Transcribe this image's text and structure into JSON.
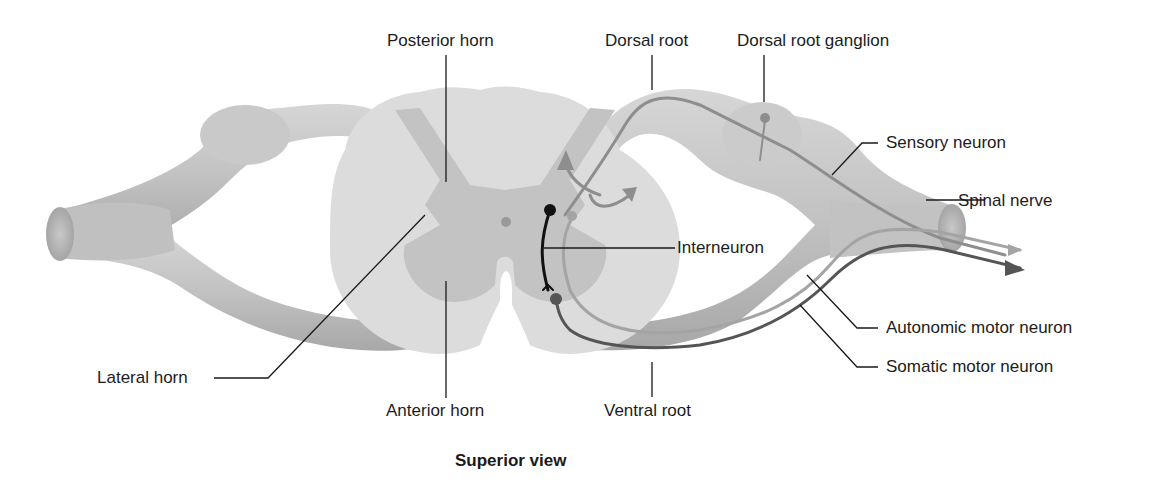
{
  "figure": {
    "caption": "Superior view",
    "labels": {
      "posterior_horn": "Posterior horn",
      "dorsal_root": "Dorsal root",
      "dorsal_root_ganglion": "Dorsal root ganglion",
      "sensory_neuron": "Sensory neuron",
      "spinal_nerve": "Spinal nerve",
      "interneuron": "Interneuron",
      "autonomic_motor_neuron": "Autonomic motor neuron",
      "somatic_motor_neuron": "Somatic motor neuron",
      "ventral_root": "Ventral root",
      "anterior_horn": "Anterior horn",
      "lateral_horn": "Lateral horn"
    },
    "colors": {
      "nerve": "#c4c4c4",
      "nerve_shadow": "#a9a9a9",
      "white_matter": "#dcdcdc",
      "gray_matter": "#c3c3c3",
      "sensory_path": "#8e8e8e",
      "autonomic_path": "#a0a0a0",
      "somatic_path": "#555555",
      "interneuron": "#111111",
      "leader_line": "#1a1a1a"
    }
  }
}
